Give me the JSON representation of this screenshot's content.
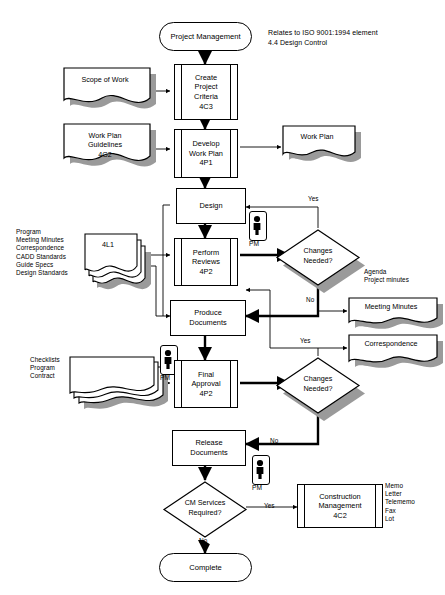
{
  "diagram": {
    "note": "Relates to ISO 9001:1994 element\n4.4 Design Control",
    "colors": {
      "line": "#000000",
      "shadow": "#9a9a9a",
      "thin": "#808080",
      "fill": "#ffffff"
    }
  },
  "nodes": {
    "start": {
      "label": "Project Management"
    },
    "scope_of_work": {
      "label": "Scope of Work"
    },
    "create_project_criteria": {
      "label": "Create\nProject\nCriteria\n4C3"
    },
    "work_plan_guidelines": {
      "label": "Work Plan\nGuidelines\n4G2"
    },
    "develop_work_plan": {
      "label": "Develop\nWork Plan\n4P1"
    },
    "work_plan_output": {
      "label": "Work Plan"
    },
    "design": {
      "label": "Design"
    },
    "inputs_4l1": {
      "label": "4L1"
    },
    "perform_reviews": {
      "label": "Perform\nReviews\n4P2"
    },
    "changes_needed_1": {
      "label": "Changes\nNeeded?"
    },
    "produce_documents": {
      "label": "Produce\nDocuments"
    },
    "meeting_minutes": {
      "label": "Meeting Minutes"
    },
    "correspondence": {
      "label": "Correspondence"
    },
    "checklists_stack": {
      "label": ""
    },
    "final_approval": {
      "label": "Final\nApproval\n4P2"
    },
    "changes_needed_2": {
      "label": "Changes\nNeeded?"
    },
    "release_documents": {
      "label": "Release\nDocuments"
    },
    "cm_services_required": {
      "label": "CM Services\nRequired?"
    },
    "construction_management": {
      "label": "Construction\nManagement\n4C2"
    },
    "complete": {
      "label": "Complete"
    }
  },
  "annotations": {
    "design_inputs_list": "Program\nMeeting Minutes\nCorrespondence\nCADD Standards\nGuide Specs\nDesign Standards",
    "review_outputs_list": "Agenda\nProject minutes",
    "approval_inputs_list": "Checklists\nProgram\nContract",
    "cm_outputs_list": "Memo\nLetter\nTelememo\nFax\nLot",
    "pm_role_1": "PM",
    "pm_role_2": "PM",
    "pm_role_3": "PM"
  },
  "edge_labels": {
    "yes_1": "Yes",
    "no_1": "No",
    "yes_2": "Yes",
    "no_2": "No",
    "yes_3": "Yes",
    "no_3": "No"
  }
}
